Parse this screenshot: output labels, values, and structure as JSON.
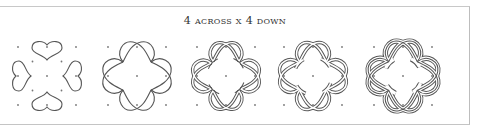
{
  "title": "4 across x 4 down",
  "colors": {
    "line": "#555555",
    "dot": "#777777",
    "frame": "#c4c4c4"
  },
  "panels": [
    {
      "step": 1,
      "label": "heart shapes",
      "center_x": 47
    },
    {
      "step": 2,
      "label": "interlaced loops",
      "center_x": 137
    },
    {
      "step": 3,
      "label": "doubled lines",
      "center_x": 226
    },
    {
      "step": 4,
      "label": "doubled ring",
      "center_x": 313
    },
    {
      "step": 5,
      "label": "full knot",
      "center_x": 403
    }
  ]
}
